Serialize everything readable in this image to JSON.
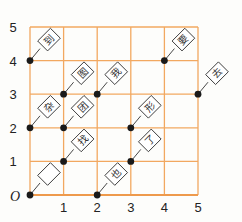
{
  "diagram": {
    "type": "coordinate-grid-with-flags",
    "grid": {
      "x_min": 0,
      "x_max": 5,
      "y_min": 0,
      "y_max": 5,
      "line_color": "#f2a860",
      "border_color": "#ee9a4c"
    },
    "origin_label": "O",
    "x_ticks": [
      "1",
      "2",
      "3",
      "4",
      "5"
    ],
    "y_ticks": [
      "1",
      "2",
      "3",
      "4",
      "5"
    ],
    "point_color": "#1a1a1a",
    "points": [
      {
        "x": 0,
        "y": 4,
        "char": "到"
      },
      {
        "x": 1,
        "y": 3,
        "char": "图"
      },
      {
        "x": 2,
        "y": 3,
        "char": "我"
      },
      {
        "x": 4,
        "y": 4,
        "char": "要"
      },
      {
        "x": 5,
        "y": 3,
        "char": "去"
      },
      {
        "x": 0,
        "y": 2,
        "char": "杂"
      },
      {
        "x": 1,
        "y": 2,
        "char": "团"
      },
      {
        "x": 3,
        "y": 2,
        "char": "形"
      },
      {
        "x": 1,
        "y": 1,
        "char": "找"
      },
      {
        "x": 3,
        "y": 1,
        "char": "了"
      },
      {
        "x": 0,
        "y": 0,
        "char": ""
      },
      {
        "x": 2,
        "y": 0,
        "char": "也"
      }
    ]
  }
}
